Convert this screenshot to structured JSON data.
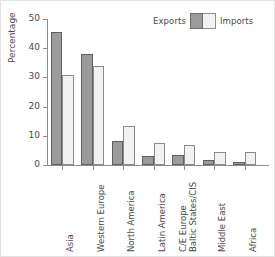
{
  "chart_data": {
    "type": "bar",
    "title": "",
    "xlabel": "",
    "ylabel": "Percentage",
    "ylim": [
      0,
      50
    ],
    "yticks": [
      0,
      10,
      20,
      30,
      40,
      50
    ],
    "grid": false,
    "legend_position": "top-right",
    "categories": [
      "Asia",
      "Western Europe",
      "North America",
      "Latin America",
      "C/E Europe Baltic States/CIS",
      "Middle East",
      "Africa"
    ],
    "category_lines": [
      [
        "Asia"
      ],
      [
        "Western Europe"
      ],
      [
        "North America"
      ],
      [
        "Latin America"
      ],
      [
        "C/E Europe",
        "Baltic States/CIS"
      ],
      [
        "Middle East"
      ],
      [
        "Africa"
      ]
    ],
    "series": [
      {
        "name": "Exports",
        "color": "#9b9b9b",
        "edge": "#5f5f5f",
        "values": [
          45.5,
          38.0,
          8.3,
          3.1,
          3.4,
          1.7,
          1.2
        ]
      },
      {
        "name": "Imports",
        "color": "#f2f2f2",
        "edge": "#8a8a8a",
        "values": [
          30.7,
          33.8,
          13.2,
          7.4,
          6.7,
          4.3,
          4.5
        ]
      }
    ]
  },
  "legend": {
    "exports_label": "Exports",
    "imports_label": "Imports"
  },
  "axes": {
    "y_title": "Percentage"
  },
  "colors": {
    "exports_fill": "#9b9b9b",
    "imports_fill": "#f2f2f2",
    "axis": "#8d8d8d",
    "text": "#4a4a4a",
    "background": "#ffffff"
  }
}
